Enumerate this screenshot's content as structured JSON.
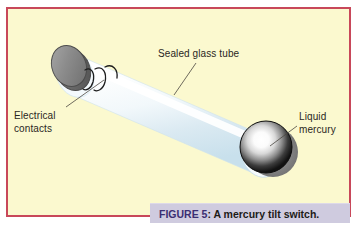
{
  "figure": {
    "caption_label": "FIGURE 5",
    "caption_separator": ": ",
    "caption_text": "A mercury tilt switch.",
    "caption_full": "FIGURE 5: A mercury tilt switch."
  },
  "panel": {
    "background_color": "#fbf9cf",
    "border_color": "#c8485a"
  },
  "caption": {
    "background_color": "#cfcbdf",
    "label_color": "#3b2f73",
    "text_color": "#1d1b18"
  },
  "labels": {
    "sealed_glass_tube": "Sealed glass tube",
    "electrical_contacts_line1": "Electrical",
    "electrical_contacts_line2": "contacts",
    "liquid_mercury_line1": "Liquid",
    "liquid_mercury_line2": "mercury"
  },
  "diagram": {
    "title": "mercury tilt switch",
    "parts": [
      {
        "name": "sealed-glass-tube",
        "label": "Sealed glass tube",
        "color": "#eef6fa"
      },
      {
        "name": "electrical-contacts",
        "label": "Electrical contacts",
        "color": "#8b8b8b"
      },
      {
        "name": "liquid-mercury",
        "label": "Liquid mercury",
        "color": "#2b2b2b"
      }
    ]
  }
}
